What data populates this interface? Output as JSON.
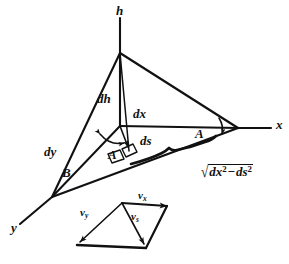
{
  "figure": {
    "ink_color": "#111111",
    "background_color": "#ffffff",
    "axes": [
      {
        "name": "h-axis",
        "label": "h"
      },
      {
        "name": "x-axis",
        "label": "x"
      },
      {
        "name": "y-axis",
        "label": "y"
      }
    ],
    "segment_labels": [
      {
        "name": "dh",
        "label": "dh"
      },
      {
        "name": "dx",
        "label": "dx"
      },
      {
        "name": "dy",
        "label": "dy"
      },
      {
        "name": "ds",
        "label": "ds"
      },
      {
        "name": "B",
        "label": "B"
      }
    ],
    "angle_labels": [
      {
        "name": "angle-A-left",
        "label": "A"
      },
      {
        "name": "angle-A-right",
        "label": "A"
      }
    ],
    "formula": {
      "radical_sign": "√",
      "term1_base": "dx",
      "term1_exp": "2",
      "operator": "−",
      "term2_base": "ds",
      "term2_exp": "2",
      "plain": "√(dx² − ds²)"
    },
    "velocity_diagram": {
      "name": "velocity-parallelogram",
      "vectors": [
        {
          "name": "v-x",
          "base": "v",
          "sub": "x"
        },
        {
          "name": "v-y",
          "base": "v",
          "sub": "y"
        },
        {
          "name": "v-s",
          "base": "v",
          "sub": "s"
        }
      ]
    }
  }
}
